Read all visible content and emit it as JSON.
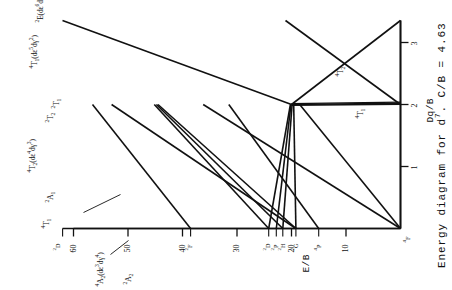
{
  "caption": {
    "prefix": "Energy diagram for d",
    "superscript": "7",
    "suffix": ". C/B = 4.63"
  },
  "axes": {
    "x_title": "Dq/B",
    "y_title": "E/B",
    "x_ticks": [
      "1",
      "2",
      "3"
    ],
    "y_ticks": [
      "10",
      "20",
      "30",
      "40",
      "50",
      "60"
    ]
  },
  "free_ion_terms": [
    {
      "label": "4F",
      "html": "<sup>4</sup>F",
      "e": 0.0
    },
    {
      "label": "4P",
      "html": "<sup>4</sup>P",
      "e": 15.0
    },
    {
      "label": "2G",
      "html": "<sup>2</sup>G",
      "e": 19.2
    },
    {
      "label": "2H",
      "html": "<sup>2</sup>H",
      "e": 21.6
    },
    {
      "label": "2P",
      "html": "<sup>2</sup>P",
      "e": 22.8
    },
    {
      "label": "2D",
      "html": "<sup>2</sup>D",
      "e": 24.2
    },
    {
      "label": "2F",
      "html": "<sup>2</sup>F",
      "e": 38.5
    },
    {
      "label": "2D2",
      "html": "<sup>2</sup>D",
      "e": 62.0
    }
  ],
  "state_labels": [
    {
      "name": "4A2",
      "html": "<sup>4</sup>A<sub>2</sub>(d&epsilon;<sup>3</sup>d&gamma;<sup>4</sup>)"
    },
    {
      "name": "4T1h",
      "html": "<sup>4</sup>T<sub>1</sub>"
    },
    {
      "name": "2A1",
      "html": "<sup>2</sup>A<sub>1</sub>"
    },
    {
      "name": "2A2",
      "html": "<sup>2</sup>A<sub>2</sub>"
    },
    {
      "name": "4T2",
      "html": "<sup>4</sup>T<sub>2</sub>(d&epsilon;<sup>4</sup>d&gamma;<sup>3</sup>)"
    },
    {
      "name": "2T2",
      "html": "<sup>2</sup>T<sub>2</sub>"
    },
    {
      "name": "2T1",
      "html": "<sup>2</sup>T<sub>1</sub>"
    },
    {
      "name": "4T1",
      "html": "<sup>4</sup>T<sub>1</sub>(d&epsilon;<sup>5</sup>d&gamma;<sup>2</sup>)"
    },
    {
      "name": "2E",
      "html": "<sup>2</sup>E(d&epsilon;<sup>6</sup>d&gamma;<sup>1</sup>)"
    },
    {
      "name": "4T2low",
      "html": "<sup>4</sup>T<sub>2</sub>"
    },
    {
      "name": "4T1low",
      "html": "<sup>4</sup>T<sub>1</sub>"
    },
    {
      "name": "4Forigin",
      "html": "<sup>4</sup>F"
    }
  ],
  "chart_data": {
    "type": "line",
    "title": "Energy diagram for d7. C/B = 4.63",
    "xlabel": "Dq/B",
    "ylabel": "E/B",
    "xlim": [
      0,
      3.35
    ],
    "ylim": [
      0,
      66
    ],
    "grid": false,
    "legend": "inline-labels",
    "x_ticks": [
      1,
      2,
      3
    ],
    "y_ticks": [
      10,
      20,
      30,
      40,
      50,
      60
    ],
    "series": [
      {
        "name": "4T1(F) ground",
        "points": [
          [
            0,
            0
          ],
          [
            2,
            0
          ]
        ]
      },
      {
        "name": "4T2(F)",
        "points": [
          [
            0,
            0
          ],
          [
            2,
            18.5
          ]
        ]
      },
      {
        "name": "4A2(F)",
        "points": [
          [
            0,
            0
          ],
          [
            2,
            36.2
          ]
        ]
      },
      {
        "name": "4T1(P)",
        "points": [
          [
            0,
            15.0
          ],
          [
            2,
            31.5
          ]
        ]
      },
      {
        "name": "2E(G)",
        "points": [
          [
            0,
            19.2
          ],
          [
            2,
            19.6
          ]
        ]
      },
      {
        "name": "2T1(G)",
        "points": [
          [
            0,
            19.2
          ],
          [
            2,
            19.6
          ]
        ]
      },
      {
        "name": "2T2(G)",
        "points": [
          [
            0,
            19.2
          ],
          [
            2,
            44.5
          ]
        ]
      },
      {
        "name": "2A1(G)",
        "points": [
          [
            0,
            19.2
          ],
          [
            2,
            53.0
          ]
        ]
      },
      {
        "name": "2T1(H)",
        "points": [
          [
            0,
            21.6
          ],
          [
            2,
            19.9
          ]
        ]
      },
      {
        "name": "2T2(H)",
        "points": [
          [
            0,
            21.6
          ],
          [
            2,
            44.8
          ]
        ]
      },
      {
        "name": "2E(H)",
        "points": [
          [
            0,
            21.6
          ],
          [
            2,
            19.8
          ]
        ]
      },
      {
        "name": "2T1(P)",
        "points": [
          [
            0,
            22.8
          ],
          [
            2,
            20.1
          ]
        ]
      },
      {
        "name": "2A2(F)",
        "points": [
          [
            0,
            38.5
          ],
          [
            2,
            56.5
          ]
        ]
      },
      {
        "name": "2E(D)",
        "points": [
          [
            0,
            24.2
          ],
          [
            2,
            20.2
          ]
        ]
      },
      {
        "name": "2T2(D)",
        "points": [
          [
            0,
            24.2
          ],
          [
            2,
            45.2
          ]
        ]
      },
      {
        "name": "right-branch-4T2",
        "points": [
          [
            2,
            0
          ],
          [
            3.3,
            21.0
          ]
        ]
      },
      {
        "name": "right-branch-4T1",
        "points": [
          [
            2,
            0
          ],
          [
            3.3,
            -999
          ]
        ]
      },
      {
        "name": "2E-doublet-high",
        "points": [
          [
            2,
            19.8
          ],
          [
            3.3,
            62.0
          ]
        ]
      }
    ]
  }
}
